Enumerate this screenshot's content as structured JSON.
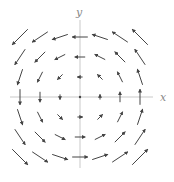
{
  "chart_data": {
    "type": "vector_field",
    "title": "",
    "xlabel": "x",
    "ylabel": "y",
    "field": "F(x,y) = (-y, x)",
    "grid": {
      "x": [
        -3,
        -2,
        -1,
        0,
        1,
        2,
        3
      ],
      "y": [
        -3,
        -2,
        -1,
        0,
        1,
        2,
        3
      ]
    },
    "xlim": [
      -3.5,
      3.5
    ],
    "ylim": [
      -3.5,
      3.5
    ],
    "arrow_color": "#444444",
    "axis_color": "#bbbbbb"
  },
  "axes": {
    "x_label": "x",
    "y_label": "y"
  }
}
